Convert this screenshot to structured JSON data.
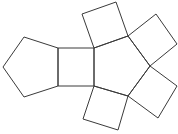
{
  "diagram": {
    "stroke_color": "#3a3a3a",
    "background_color": "#ffffff",
    "faces": [
      {
        "name": "pentagon-left",
        "shape": "pentagon"
      },
      {
        "name": "square-middle",
        "shape": "square"
      },
      {
        "name": "pentagon-right",
        "shape": "pentagon"
      },
      {
        "name": "square-top",
        "shape": "square"
      },
      {
        "name": "square-upper-right",
        "shape": "square"
      },
      {
        "name": "square-lower-right",
        "shape": "square"
      },
      {
        "name": "square-bottom",
        "shape": "square"
      }
    ]
  }
}
